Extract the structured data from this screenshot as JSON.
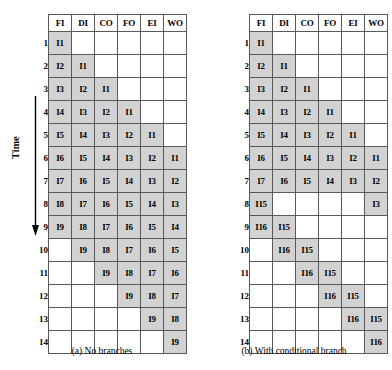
{
  "figure": {
    "axis": {
      "time_label": "Time",
      "arrow_icon": "down-arrow-icon"
    },
    "colors": {
      "filled_cell": "#d2d2d2",
      "empty_cell": "#ffffff",
      "grid_line": "#595959",
      "text": "#000000"
    },
    "panels": [
      {
        "id": "a",
        "caption": "(a) No branches",
        "columns": [
          "FI",
          "DI",
          "CO",
          "FO",
          "EI",
          "WO"
        ],
        "rows": [
          "1",
          "2",
          "3",
          "4",
          "5",
          "6",
          "7",
          "8",
          "9",
          "10",
          "11",
          "12",
          "13",
          "14"
        ],
        "cells": [
          [
            "I1",
            "",
            "",
            "",
            "",
            ""
          ],
          [
            "I2",
            "I1",
            "",
            "",
            "",
            ""
          ],
          [
            "I3",
            "I2",
            "I1",
            "",
            "",
            ""
          ],
          [
            "I4",
            "I3",
            "I2",
            "I1",
            "",
            ""
          ],
          [
            "I5",
            "I4",
            "I3",
            "I2",
            "I1",
            ""
          ],
          [
            "I6",
            "I5",
            "I4",
            "I3",
            "I2",
            "I1"
          ],
          [
            "I7",
            "I6",
            "I5",
            "I4",
            "I3",
            "I2"
          ],
          [
            "I8",
            "I7",
            "I6",
            "I5",
            "I4",
            "I3"
          ],
          [
            "I9",
            "I8",
            "I7",
            "I6",
            "I5",
            "I4"
          ],
          [
            "",
            "I9",
            "I8",
            "I7",
            "I6",
            "I5"
          ],
          [
            "",
            "",
            "I9",
            "I8",
            "I7",
            "I6"
          ],
          [
            "",
            "",
            "",
            "I9",
            "I8",
            "I7"
          ],
          [
            "",
            "",
            "",
            "",
            "I9",
            "I8"
          ],
          [
            "",
            "",
            "",
            "",
            "",
            "I9"
          ]
        ]
      },
      {
        "id": "b",
        "caption": "(b) With conditional branch",
        "columns": [
          "FI",
          "DI",
          "CO",
          "FO",
          "EI",
          "WO"
        ],
        "rows": [
          "1",
          "2",
          "3",
          "4",
          "5",
          "6",
          "7",
          "8",
          "9",
          "10",
          "11",
          "12",
          "13",
          "14"
        ],
        "cells": [
          [
            "I1",
            "",
            "",
            "",
            "",
            ""
          ],
          [
            "I2",
            "I1",
            "",
            "",
            "",
            ""
          ],
          [
            "I3",
            "I2",
            "I1",
            "",
            "",
            ""
          ],
          [
            "I4",
            "I3",
            "I2",
            "I1",
            "",
            ""
          ],
          [
            "I5",
            "I4",
            "I3",
            "I2",
            "I1",
            ""
          ],
          [
            "I6",
            "I5",
            "I4",
            "I3",
            "I2",
            "I1"
          ],
          [
            "I7",
            "I6",
            "I5",
            "I4",
            "I3",
            "I2"
          ],
          [
            "I15",
            "",
            "",
            "",
            "",
            "I3"
          ],
          [
            "I16",
            "I15",
            "",
            "",
            "",
            ""
          ],
          [
            "",
            "I16",
            "I15",
            "",
            "",
            ""
          ],
          [
            "",
            "",
            "I16",
            "I15",
            "",
            ""
          ],
          [
            "",
            "",
            "",
            "I16",
            "I15",
            ""
          ],
          [
            "",
            "",
            "",
            "",
            "I16",
            "I15"
          ],
          [
            "",
            "",
            "",
            "",
            "",
            "I16"
          ]
        ]
      }
    ]
  }
}
